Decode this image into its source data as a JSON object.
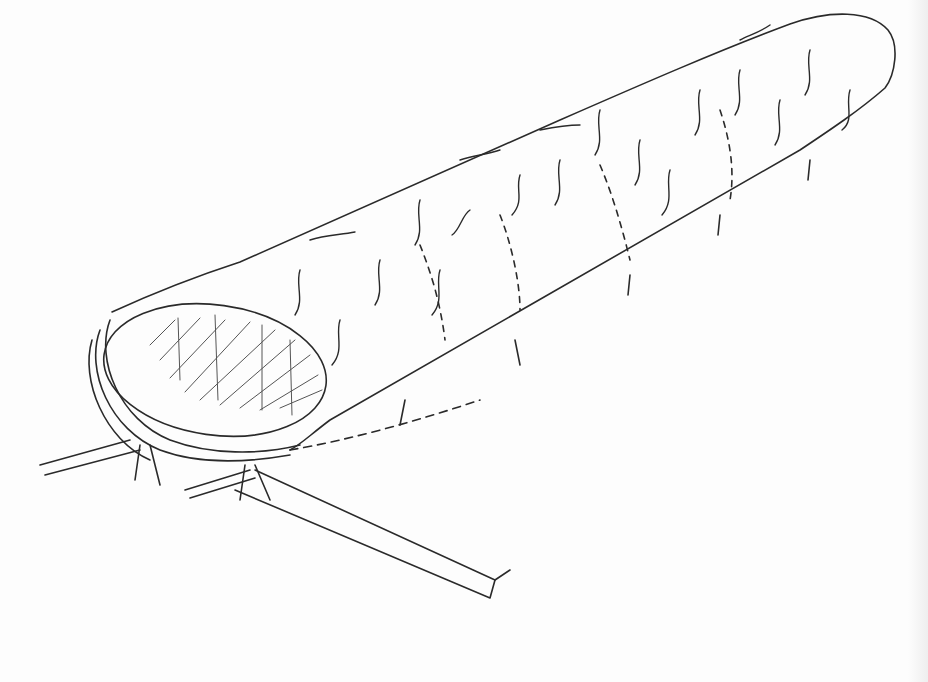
{
  "image": {
    "subject": "hand-drawn sketch of a long cylindrical tunnel structure on legs",
    "colors": {
      "paper": "#fdfdfd",
      "ink": "#2a2a2a",
      "shadow_edge": "#eeeeee"
    },
    "elements": [
      "cylinder-body",
      "oval-opening-hatched",
      "ring-frames",
      "leaf-marks",
      "support-legs",
      "base-strip"
    ]
  }
}
